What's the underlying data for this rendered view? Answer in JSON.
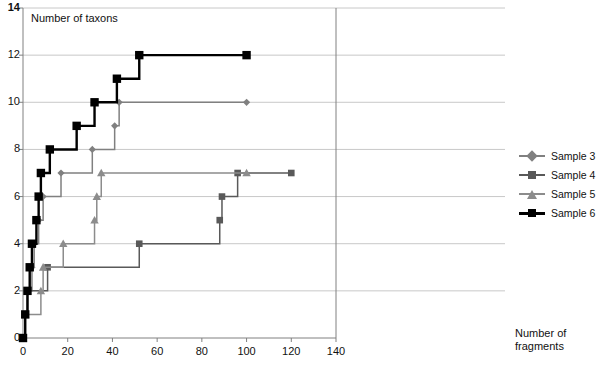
{
  "chart_data": {
    "type": "line",
    "title": "",
    "ylabel": "Number of taxons",
    "xlabel": "Number of fragments",
    "xlim": [
      0,
      140
    ],
    "ylim": [
      0,
      14
    ],
    "xticks": [
      0,
      20,
      40,
      60,
      80,
      100,
      120,
      140
    ],
    "yticks": [
      0,
      2,
      4,
      6,
      8,
      10,
      12,
      14
    ],
    "grid": "horizontal",
    "legend_position": "right",
    "step_style": "post",
    "series": [
      {
        "name": "Sample 3",
        "color": "#808080",
        "marker": "diamond",
        "points": [
          {
            "x": 0,
            "y": 0
          },
          {
            "x": 1,
            "y": 1
          },
          {
            "x": 2,
            "y": 2
          },
          {
            "x": 4,
            "y": 3
          },
          {
            "x": 5,
            "y": 4
          },
          {
            "x": 7,
            "y": 5
          },
          {
            "x": 9,
            "y": 6
          },
          {
            "x": 17,
            "y": 7
          },
          {
            "x": 31,
            "y": 8
          },
          {
            "x": 41,
            "y": 9
          },
          {
            "x": 43,
            "y": 10
          },
          {
            "x": 100,
            "y": 10
          }
        ]
      },
      {
        "name": "Sample 4",
        "color": "#595959",
        "marker": "square",
        "points": [
          {
            "x": 0,
            "y": 0
          },
          {
            "x": 1,
            "y": 1
          },
          {
            "x": 2,
            "y": 2
          },
          {
            "x": 11,
            "y": 3
          },
          {
            "x": 52,
            "y": 4
          },
          {
            "x": 88,
            "y": 5
          },
          {
            "x": 89,
            "y": 6
          },
          {
            "x": 96,
            "y": 7
          },
          {
            "x": 120,
            "y": 7
          }
        ]
      },
      {
        "name": "Sample 5",
        "color": "#8c8c8c",
        "marker": "triangle",
        "points": [
          {
            "x": 0,
            "y": 0
          },
          {
            "x": 1,
            "y": 1
          },
          {
            "x": 8,
            "y": 2
          },
          {
            "x": 9,
            "y": 3
          },
          {
            "x": 18,
            "y": 4
          },
          {
            "x": 32,
            "y": 5
          },
          {
            "x": 33,
            "y": 6
          },
          {
            "x": 35,
            "y": 7
          },
          {
            "x": 100,
            "y": 7
          }
        ]
      },
      {
        "name": "Sample 6",
        "color": "#000000",
        "marker": "square",
        "points": [
          {
            "x": 0,
            "y": 0
          },
          {
            "x": 1,
            "y": 1
          },
          {
            "x": 2,
            "y": 2
          },
          {
            "x": 3,
            "y": 3
          },
          {
            "x": 4,
            "y": 4
          },
          {
            "x": 6,
            "y": 5
          },
          {
            "x": 7,
            "y": 6
          },
          {
            "x": 8,
            "y": 7
          },
          {
            "x": 12,
            "y": 8
          },
          {
            "x": 24,
            "y": 9
          },
          {
            "x": 32,
            "y": 10
          },
          {
            "x": 42,
            "y": 11
          },
          {
            "x": 52,
            "y": 12
          },
          {
            "x": 100,
            "y": 12
          }
        ]
      }
    ]
  },
  "legend": {
    "items": [
      {
        "label": "Sample 3"
      },
      {
        "label": "Sample 4"
      },
      {
        "label": "Sample 5"
      },
      {
        "label": "Sample 6"
      }
    ]
  }
}
